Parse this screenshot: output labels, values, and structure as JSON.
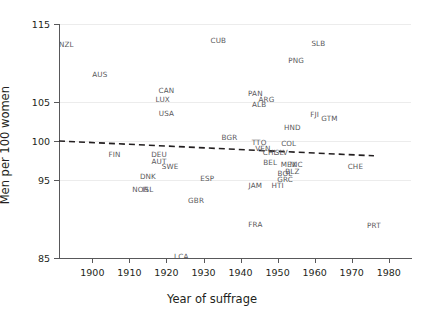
{
  "chart_data": {
    "type": "scatter",
    "title": "",
    "xlabel": "Year of suffrage",
    "ylabel": "Men per 100 women",
    "xlim": [
      1891,
      1986
    ],
    "ylim": [
      85,
      115
    ],
    "xticks": [
      1900,
      1910,
      1920,
      1930,
      1940,
      1950,
      1960,
      1970,
      1980
    ],
    "xticklabels": [
      "1900",
      "1910",
      "1920",
      "1930",
      "1940",
      "1950",
      "1960",
      "1970",
      "1980"
    ],
    "yticks": [
      85,
      95,
      100,
      105,
      115
    ],
    "yticklabels": [
      "85",
      "95",
      "100",
      "105",
      "115"
    ],
    "grid": "horizontal",
    "legend": "none",
    "marker_style": "text-label",
    "points": [
      {
        "label": "NZL",
        "x": 1893,
        "y": 112.4
      },
      {
        "label": "AUS",
        "x": 1902,
        "y": 108.6
      },
      {
        "label": "CUB",
        "x": 1934,
        "y": 113.0
      },
      {
        "label": "SLB",
        "x": 1961,
        "y": 112.6
      },
      {
        "label": "PNG",
        "x": 1955,
        "y": 110.4
      },
      {
        "label": "CAN",
        "x": 1920,
        "y": 106.6
      },
      {
        "label": "LUX",
        "x": 1919,
        "y": 105.4
      },
      {
        "label": "USA",
        "x": 1920,
        "y": 103.6
      },
      {
        "label": "PAN",
        "x": 1944,
        "y": 106.2
      },
      {
        "label": "ARG",
        "x": 1947,
        "y": 105.4
      },
      {
        "label": "ALB",
        "x": 1945,
        "y": 104.7
      },
      {
        "label": "FJI",
        "x": 1960,
        "y": 103.5
      },
      {
        "label": "GTM",
        "x": 1964,
        "y": 102.9
      },
      {
        "label": "HND",
        "x": 1954,
        "y": 101.8
      },
      {
        "label": "BGR",
        "x": 1937,
        "y": 100.5
      },
      {
        "label": "TTO",
        "x": 1945,
        "y": 99.9
      },
      {
        "label": "COL",
        "x": 1953,
        "y": 99.7
      },
      {
        "label": "VEN",
        "x": 1946,
        "y": 99.1
      },
      {
        "label": "CHL",
        "x": 1948,
        "y": 98.6
      },
      {
        "label": "SLV",
        "x": 1951,
        "y": 98.6
      },
      {
        "label": "FIN",
        "x": 1906,
        "y": 98.3
      },
      {
        "label": "DEU",
        "x": 1918,
        "y": 98.3
      },
      {
        "label": "AUT",
        "x": 1918,
        "y": 97.5
      },
      {
        "label": "SWE",
        "x": 1921,
        "y": 96.8
      },
      {
        "label": "BEL",
        "x": 1948,
        "y": 97.3
      },
      {
        "label": "MEX",
        "x": 1953,
        "y": 97.0
      },
      {
        "label": "NIC",
        "x": 1955,
        "y": 97.0
      },
      {
        "label": "CHE",
        "x": 1971,
        "y": 96.8
      },
      {
        "label": "DNK",
        "x": 1915,
        "y": 95.5
      },
      {
        "label": "ESP",
        "x": 1931,
        "y": 95.3
      },
      {
        "label": "BLZ",
        "x": 1954,
        "y": 96.2
      },
      {
        "label": "BOL",
        "x": 1952,
        "y": 95.9
      },
      {
        "label": "GRC",
        "x": 1952,
        "y": 95.1
      },
      {
        "label": "NOR",
        "x": 1913,
        "y": 93.9
      },
      {
        "label": "ISL",
        "x": 1915,
        "y": 93.8
      },
      {
        "label": "JAM",
        "x": 1944,
        "y": 94.3
      },
      {
        "label": "HTI",
        "x": 1950,
        "y": 94.3
      },
      {
        "label": "GBR",
        "x": 1928,
        "y": 92.5
      },
      {
        "label": "FRA",
        "x": 1944,
        "y": 89.3
      },
      {
        "label": "PRT",
        "x": 1976,
        "y": 89.2
      },
      {
        "label": "LCA",
        "x": 1924,
        "y": 85.2
      }
    ],
    "trendline": {
      "style": "dashed",
      "color": "#231f20",
      "x_start": 1891,
      "y_start": 100.0,
      "x_end": 1976,
      "y_end": 98.1
    }
  }
}
